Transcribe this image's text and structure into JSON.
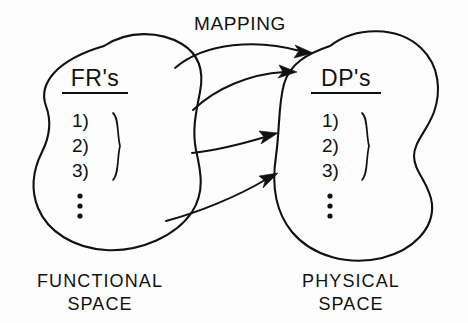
{
  "figure": {
    "background_color": "#fdfdfd",
    "ink_color": "#111111",
    "mapping_label": "MAPPING"
  },
  "left_set": {
    "title": "FR's",
    "caption_line1": "FUNCTIONAL",
    "caption_line2": "SPACE",
    "items": [
      "1)",
      "2)",
      "3)"
    ],
    "ellipsis": "⋮"
  },
  "right_set": {
    "title": "DP's",
    "caption_line1": "PHYSICAL",
    "caption_line2": "SPACE",
    "items": [
      "1)",
      "2)",
      "3)"
    ],
    "ellipsis": "⋮"
  },
  "arrows": [
    {
      "name": "mapping-arrow-1"
    },
    {
      "name": "mapping-arrow-2"
    },
    {
      "name": "mapping-arrow-3"
    },
    {
      "name": "mapping-arrow-4"
    }
  ]
}
